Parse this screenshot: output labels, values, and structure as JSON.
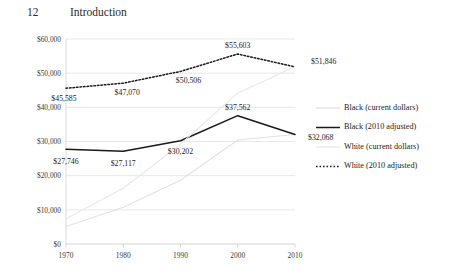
{
  "running_head": {
    "folio": "12",
    "title": "Introduction"
  },
  "chart_data": {
    "type": "line",
    "title": "",
    "subtitle": "",
    "xlabel": "",
    "ylabel": "",
    "x": [
      1970,
      1980,
      1990,
      2000,
      2010
    ],
    "xtick_labels": [
      "1970",
      "1980",
      "1990",
      "2000",
      "2010"
    ],
    "ylim": [
      0,
      60000
    ],
    "yticks": [
      0,
      10000,
      20000,
      30000,
      40000,
      50000,
      60000
    ],
    "ytick_labels": [
      "$0",
      "$10,000",
      "$20,000",
      "$30,000",
      "$40,000",
      "$50,000",
      "$60,000"
    ],
    "grid": true,
    "legend_position": "right",
    "series": [
      {
        "name": "Black (current dollars)",
        "style": "solid-light",
        "color": "#e2e2e2",
        "values": [
          5120,
          10760,
          18680,
          30440,
          32068
        ],
        "labels": [
          "",
          "",
          "",
          "",
          ""
        ]
      },
      {
        "name": "Black (2010 adjusted)",
        "style": "solid-dark",
        "color": "#1a1a1a",
        "values": [
          27746,
          27117,
          30202,
          37562,
          32068
        ],
        "labels": [
          "$27,746",
          "$27,117",
          "$30,202",
          "$37,562",
          "$32,068"
        ]
      },
      {
        "name": "White (current dollars)",
        "style": "solid-light",
        "color": "#e8e8e8",
        "values": [
          7400,
          16330,
          29210,
          44230,
          51846
        ],
        "labels": [
          "",
          "",
          "",
          "",
          ""
        ]
      },
      {
        "name": "White (2010 adjusted)",
        "style": "dotted-dark",
        "color": "#1a1a1a",
        "values": [
          45585,
          47070,
          50506,
          55603,
          51846
        ],
        "labels": [
          "$45,585",
          "$47,070",
          "$50,506",
          "$55,603",
          "$51,846"
        ]
      }
    ],
    "legend_entries": [
      {
        "label": "Black (current dollars)",
        "style": "solid-light",
        "color": "#dcdcdc"
      },
      {
        "label": "Black (2010 adjusted)",
        "style": "solid-dark",
        "color": "#1a1a1a"
      },
      {
        "label": "White (current dollars)",
        "style": "solid-light",
        "color": "#e4e4e4"
      },
      {
        "label": "White (2010 adjusted)",
        "style": "dotted-dark",
        "color": "#1a1a1a"
      }
    ]
  }
}
